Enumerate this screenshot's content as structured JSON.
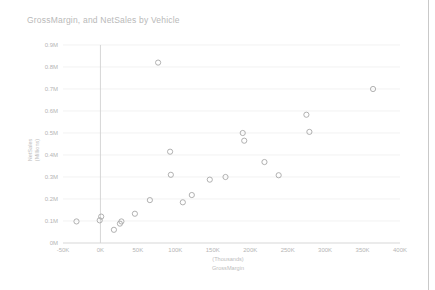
{
  "chart_data": {
    "type": "scatter",
    "title": "GrossMargin, and NetSales by Vehicle",
    "xlabel": "GrossMargin",
    "xlabel_units": "(Thousands)",
    "ylabel": "NetSales",
    "ylabel_units": "(Millions)",
    "xlim": [
      -50000,
      400000
    ],
    "ylim": [
      0,
      900000
    ],
    "x_tick_labels": [
      "-50K",
      "0K",
      "50K",
      "100K",
      "150K",
      "200K",
      "250K",
      "300K",
      "350K",
      "400K"
    ],
    "x_tick_values": [
      -50000,
      0,
      50000,
      100000,
      150000,
      200000,
      250000,
      300000,
      350000,
      400000
    ],
    "y_tick_labels": [
      "0M",
      "0.1M",
      "0.2M",
      "0.3M",
      "0.4M",
      "0.5M",
      "0.6M",
      "0.7M",
      "0.8M",
      "0.9M"
    ],
    "y_tick_values": [
      0,
      100000,
      200000,
      300000,
      400000,
      500000,
      600000,
      700000,
      800000,
      900000
    ],
    "grid": true,
    "legend": false,
    "marker_style": "open-circle",
    "marker_color": "#a8a8a8",
    "points": [
      {
        "x": -32000,
        "y": 98000
      },
      {
        "x": -1000,
        "y": 103000
      },
      {
        "x": 1000,
        "y": 120000
      },
      {
        "x": 18000,
        "y": 60000
      },
      {
        "x": 26000,
        "y": 88000
      },
      {
        "x": 28000,
        "y": 98000
      },
      {
        "x": 46000,
        "y": 133000
      },
      {
        "x": 66000,
        "y": 195000
      },
      {
        "x": 77000,
        "y": 820000
      },
      {
        "x": 93000,
        "y": 415000
      },
      {
        "x": 94000,
        "y": 310000
      },
      {
        "x": 110000,
        "y": 185000
      },
      {
        "x": 122000,
        "y": 218000
      },
      {
        "x": 146000,
        "y": 288000
      },
      {
        "x": 167000,
        "y": 300000
      },
      {
        "x": 190000,
        "y": 500000
      },
      {
        "x": 192000,
        "y": 465000
      },
      {
        "x": 219000,
        "y": 368000
      },
      {
        "x": 238000,
        "y": 308000
      },
      {
        "x": 275000,
        "y": 583000
      },
      {
        "x": 279000,
        "y": 505000
      },
      {
        "x": 364000,
        "y": 700000
      }
    ]
  }
}
